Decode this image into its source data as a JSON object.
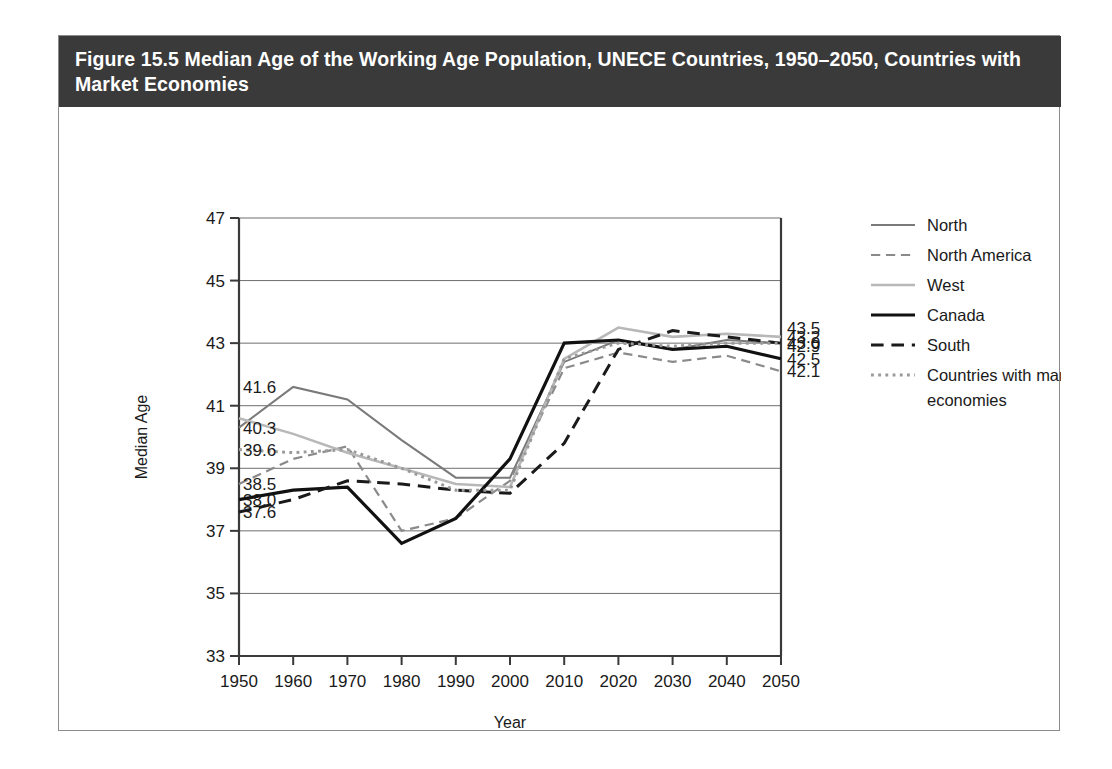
{
  "figure": {
    "title": "Figure 15.5 Median Age of the Working Age Population, UNECE Countries, 1950–2050, Countries with Market Economies"
  },
  "chart_data": {
    "type": "line",
    "title": "Figure 15.5 Median Age of the Working Age Population, UNECE Countries, 1950–2050, Countries with Market Economies",
    "xlabel": "Year",
    "ylabel": "Median Age",
    "x": [
      1950,
      1960,
      1970,
      1980,
      1990,
      2000,
      2010,
      2020,
      2030,
      2040,
      2050
    ],
    "categories": [
      "1950",
      "1960",
      "1970",
      "1980",
      "1990",
      "2000",
      "2010",
      "2020",
      "2030",
      "2040",
      "2050"
    ],
    "xlim": [
      1950,
      2050
    ],
    "ylim": [
      33,
      47
    ],
    "yticks": [
      33,
      35,
      37,
      39,
      41,
      43,
      45,
      47
    ],
    "xticks": [
      1950,
      1960,
      1970,
      1980,
      1990,
      2000,
      2010,
      2020,
      2030,
      2040,
      2050
    ],
    "grid": "horizontal",
    "legend_position": "right",
    "series": [
      {
        "name": "North",
        "style": "solid",
        "color": "#7a7a7a",
        "width": 2.0,
        "values": [
          40.3,
          41.6,
          41.2,
          39.9,
          38.7,
          38.7,
          42.4,
          43.1,
          42.8,
          43.1,
          43.0
        ],
        "start_label": "40.3",
        "end_label": "43.0"
      },
      {
        "name": "North America",
        "style": "dashed",
        "color": "#8a8a8a",
        "width": 2.2,
        "values": [
          38.5,
          39.3,
          39.7,
          37.0,
          37.4,
          38.6,
          42.2,
          42.7,
          42.4,
          42.6,
          42.1
        ],
        "start_label": "38.5",
        "end_label": "42.1"
      },
      {
        "name": "West",
        "style": "solid",
        "color": "#b8b8b8",
        "width": 2.6,
        "values": [
          40.6,
          40.1,
          39.5,
          39.0,
          38.5,
          38.4,
          42.5,
          43.5,
          43.2,
          43.3,
          43.2
        ],
        "start_label": "",
        "end_label": "43.2"
      },
      {
        "name": "Canada",
        "style": "solid",
        "color": "#111111",
        "width": 3.2,
        "values": [
          38.0,
          38.3,
          38.4,
          36.6,
          37.4,
          39.3,
          43.0,
          43.1,
          42.8,
          42.9,
          42.5
        ],
        "start_label": "38.0",
        "end_label": "42.5"
      },
      {
        "name": "South",
        "style": "dashed",
        "color": "#1a1a1a",
        "width": 3.0,
        "values": [
          37.6,
          38.0,
          38.6,
          38.5,
          38.3,
          38.2,
          39.8,
          42.8,
          43.4,
          43.2,
          43.0
        ],
        "start_label": "37.6",
        "end_label": "43.0"
      },
      {
        "name": "Countries with market economies",
        "style": "dotted",
        "color": "#9a9a9a",
        "width": 3.0,
        "values": [
          39.6,
          39.5,
          39.6,
          39.0,
          38.3,
          38.3,
          42.5,
          43.0,
          42.9,
          43.0,
          43.0
        ],
        "start_label": "39.6",
        "end_label": "43.0"
      }
    ],
    "left_value_labels": [
      "41.6",
      "40.3",
      "39.6",
      "38.5",
      "38.0",
      "37.6"
    ],
    "right_value_labels": [
      "43.5",
      "43.2",
      "43.0",
      "42.9",
      "42.5",
      "42.1"
    ],
    "left_value_positions": [
      41.6,
      40.3,
      39.6,
      38.5,
      38.0,
      37.6
    ],
    "right_value_positions": [
      43.5,
      43.2,
      43.0,
      42.9,
      42.5,
      42.1
    ]
  },
  "legend": {
    "items": [
      {
        "label": "North"
      },
      {
        "label": "North America"
      },
      {
        "label": "West"
      },
      {
        "label": "Canada"
      },
      {
        "label": "South"
      },
      {
        "label": "Countries with market economies"
      }
    ]
  },
  "colors": {
    "title_bar": "#3a3a3a",
    "title_text": "#ffffff",
    "frame": "#8c8c8c",
    "axis": "#3a3a3a",
    "grid": "#6e6e6e",
    "background": "#ffffff"
  }
}
